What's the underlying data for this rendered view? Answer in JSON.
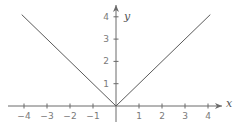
{
  "chart_data": {
    "type": "line",
    "title": "",
    "function": "y = |x|",
    "xlabel": "x",
    "ylabel": "y",
    "xlim": [
      -4.3,
      4.5
    ],
    "ylim": [
      0,
      4.3
    ],
    "x_ticks": [
      -4,
      -3,
      -2,
      -1,
      1,
      2,
      3,
      4
    ],
    "x_tick_labels": [
      "−4",
      "−3",
      "−2",
      "−1",
      "1",
      "2",
      "3",
      "4"
    ],
    "y_ticks": [
      1,
      2,
      3,
      4
    ],
    "y_tick_labels": [
      "1",
      "2",
      "3",
      "4"
    ],
    "grid": false,
    "legend": null,
    "series": [
      {
        "name": "y = |x|",
        "x": [
          -4.1,
          -3,
          -2,
          -1,
          0,
          1,
          2,
          3,
          4.1
        ],
        "y": [
          4.1,
          3,
          2,
          1,
          0,
          1,
          2,
          3,
          4.1
        ]
      }
    ]
  },
  "layout": {
    "origin_px": [
      116,
      106
    ],
    "unit_x_px": 23,
    "unit_y_px": 22.3,
    "x_axis_px": [
      8,
      222
    ],
    "y_axis_px": [
      122,
      5
    ]
  },
  "colors": {
    "axis": "#6a6a6a",
    "curve": "#5a5a5a",
    "tick_label": "#7a7a7a",
    "background": "#ffffff"
  }
}
